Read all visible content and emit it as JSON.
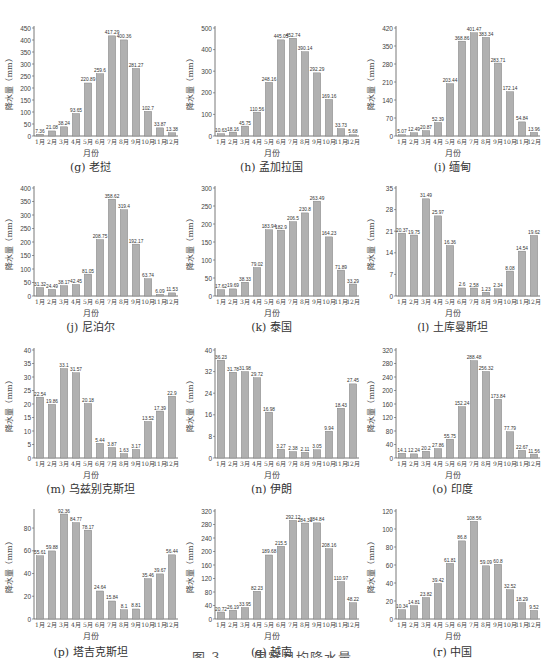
{
  "figure": {
    "caption_partial": "图 3  ……国家月均降水量",
    "month_labels": [
      "1月",
      "2月",
      "3月",
      "4月",
      "5月",
      "6月",
      "7月",
      "8月",
      "9月",
      "10月",
      "11月",
      "12月"
    ],
    "xlabel": "月份",
    "ylabel": "降水量（mm）",
    "bar_color": "#b0b0b0"
  },
  "chart_data": [
    {
      "type": "bar",
      "title": "(g) 老挝",
      "categories": [
        "1月",
        "2月",
        "3月",
        "4月",
        "5月",
        "6月",
        "7月",
        "8月",
        "9月",
        "10月",
        "11月",
        "12月"
      ],
      "values": [
        7.36,
        21.08,
        38.24,
        93.65,
        220.89,
        259.6,
        417.29,
        400.36,
        281.27,
        102.7,
        33.87,
        13.38
      ],
      "xlabel": "月份",
      "ylabel": "降水量（mm）",
      "ylim": [
        0,
        450
      ],
      "yticks": [
        0,
        50,
        100,
        150,
        200,
        250,
        300,
        350,
        400,
        450
      ]
    },
    {
      "type": "bar",
      "title": "(h) 孟加拉国",
      "categories": [
        "1月",
        "2月",
        "3月",
        "4月",
        "5月",
        "6月",
        "7月",
        "8月",
        "9月",
        "10月",
        "11月",
        "12月"
      ],
      "values": [
        10.63,
        18.16,
        45.75,
        110.56,
        248.16,
        445.05,
        452.74,
        390.14,
        292.29,
        169.16,
        33.73,
        5.68
      ],
      "xlabel": "月份",
      "ylabel": "降水量（mm）",
      "ylim": [
        0,
        500
      ],
      "yticks": [
        0,
        100,
        200,
        300,
        400,
        500
      ]
    },
    {
      "type": "bar",
      "title": "(i) 缅甸",
      "categories": [
        "1月",
        "2月",
        "3月",
        "4月",
        "5月",
        "6月",
        "7月",
        "8月",
        "9月",
        "10月",
        "11月",
        "12月"
      ],
      "values": [
        5.07,
        12.49,
        20.87,
        52.39,
        203.44,
        368.86,
        401.47,
        383.34,
        283.71,
        172.14,
        54.84,
        13.96
      ],
      "xlabel": "月份",
      "ylabel": "降水量（mm）",
      "ylim": [
        0,
        420
      ],
      "yticks": [
        0,
        70,
        140,
        210,
        280,
        350,
        420
      ]
    },
    {
      "type": "bar",
      "title": "(j) 尼泊尔",
      "categories": [
        "1月",
        "2月",
        "3月",
        "4月",
        "5月",
        "6月",
        "7月",
        "8月",
        "9月",
        "10月",
        "11月",
        "12月"
      ],
      "values": [
        31.32,
        24.49,
        38.17,
        42.45,
        81.05,
        208.75,
        358.62,
        319.4,
        192.17,
        63.74,
        6.09,
        11.53
      ],
      "xlabel": "月份",
      "ylabel": "降水量（mm）",
      "ylim": [
        0,
        400
      ],
      "yticks": [
        0,
        50,
        100,
        150,
        200,
        250,
        300,
        350,
        400
      ]
    },
    {
      "type": "bar",
      "title": "(k) 泰国",
      "categories": [
        "1月",
        "2月",
        "3月",
        "4月",
        "5月",
        "6月",
        "7月",
        "8月",
        "9月",
        "10月",
        "11月",
        "12月"
      ],
      "values": [
        17.62,
        19.69,
        38.33,
        79.02,
        183.94,
        182.9,
        206.5,
        230.8,
        263.49,
        164.23,
        71.89,
        33.29
      ],
      "xlabel": "月份",
      "ylabel": "降水量（mm）",
      "ylim": [
        0,
        300
      ],
      "yticks": [
        0,
        50,
        100,
        150,
        200,
        250,
        300
      ]
    },
    {
      "type": "bar",
      "title": "(l) 土库曼斯坦",
      "categories": [
        "1月",
        "2月",
        "3月",
        "4月",
        "5月",
        "6月",
        "7月",
        "8月",
        "9月",
        "10月",
        "11月",
        "12月"
      ],
      "values": [
        20.37,
        19.75,
        31.49,
        25.97,
        16.36,
        2.6,
        2.58,
        1.23,
        2.34,
        8.08,
        14.54,
        19.62
      ],
      "xlabel": "月份",
      "ylabel": "降水量（mm）",
      "ylim": [
        0,
        35
      ],
      "yticks": [
        0,
        7,
        14,
        21,
        28,
        35
      ]
    },
    {
      "type": "bar",
      "title": "(m) 乌兹别克斯坦",
      "categories": [
        "1月",
        "2月",
        "3月",
        "4月",
        "5月",
        "6月",
        "7月",
        "8月",
        "9月",
        "10月",
        "11月",
        "12月"
      ],
      "values": [
        22.54,
        19.86,
        33.1,
        31.57,
        20.18,
        5.44,
        3.87,
        1.63,
        3.17,
        13.52,
        17.39,
        22.9
      ],
      "xlabel": "月份",
      "ylabel": "降水量（mm）",
      "ylim": [
        0,
        40
      ],
      "yticks": [
        0,
        5,
        10,
        15,
        20,
        25,
        30,
        35,
        40
      ]
    },
    {
      "type": "bar",
      "title": "(n) 伊朗",
      "categories": [
        "1月",
        "2月",
        "3月",
        "4月",
        "5月",
        "6月",
        "7月",
        "8月",
        "9月",
        "10月",
        "11月",
        "12月"
      ],
      "values": [
        36.23,
        31.78,
        31.98,
        29.72,
        16.98,
        3.27,
        2.38,
        2.11,
        3.05,
        9.94,
        18.43,
        27.45
      ],
      "xlabel": "月份",
      "ylabel": "降水量（mm）",
      "ylim": [
        0,
        40
      ],
      "yticks": [
        0,
        8,
        16,
        24,
        32,
        40
      ]
    },
    {
      "type": "bar",
      "title": "(o) 印度",
      "categories": [
        "1月",
        "2月",
        "3月",
        "4月",
        "5月",
        "6月",
        "7月",
        "8月",
        "9月",
        "10月",
        "11月",
        "12月"
      ],
      "values": [
        14.1,
        12.24,
        20.2,
        27.86,
        55.75,
        152.24,
        288.48,
        256.32,
        173.84,
        77.79,
        22.67,
        11.56
      ],
      "xlabel": "月份",
      "ylabel": "降水量（mm）",
      "ylim": [
        0,
        320
      ],
      "yticks": [
        0,
        40,
        80,
        120,
        160,
        200,
        240,
        280,
        320
      ]
    },
    {
      "type": "bar",
      "title": "(p) 塔吉克斯坦",
      "categories": [
        "1月",
        "2月",
        "3月",
        "4月",
        "5月",
        "6月",
        "7月",
        "8月",
        "9月",
        "10月",
        "11月",
        "12月"
      ],
      "values": [
        55.61,
        59.88,
        92.36,
        84.77,
        78.17,
        24.64,
        15.84,
        8.1,
        8.81,
        35.46,
        39.67,
        56.44
      ],
      "xlabel": "月份",
      "ylabel": "降水量（mm）",
      "ylim": [
        0,
        95
      ],
      "yticks": [
        0,
        20,
        40,
        60,
        80
      ]
    },
    {
      "type": "bar",
      "title": "(q) 越南",
      "categories": [
        "1月",
        "2月",
        "3月",
        "4月",
        "5月",
        "6月",
        "7月",
        "8月",
        "9月",
        "10月",
        "11月",
        "12月"
      ],
      "values": [
        20.72,
        26.19,
        33.95,
        82.23,
        189.68,
        215.5,
        292.12,
        284.31,
        284.84,
        208.16,
        110.97,
        48.22
      ],
      "xlabel": "月份",
      "ylabel": "降水量（mm）",
      "ylim": [
        0,
        320
      ],
      "yticks": [
        0,
        40,
        80,
        120,
        160,
        200,
        240,
        280,
        320
      ]
    },
    {
      "type": "bar",
      "title": "(r) 中国",
      "categories": [
        "1月",
        "2月",
        "3月",
        "4月",
        "5月",
        "6月",
        "7月",
        "8月",
        "9月",
        "10月",
        "11月",
        "12月"
      ],
      "values": [
        10.34,
        14.81,
        23.82,
        39.42,
        61.81,
        86.8,
        108.56,
        59.09,
        60.8,
        32.52,
        18.29,
        9.52
      ],
      "xlabel": "月份",
      "ylabel": "降水量（mm）",
      "ylim": [
        0,
        120
      ],
      "yticks": [
        0,
        20,
        40,
        60,
        80,
        100,
        120
      ]
    }
  ]
}
